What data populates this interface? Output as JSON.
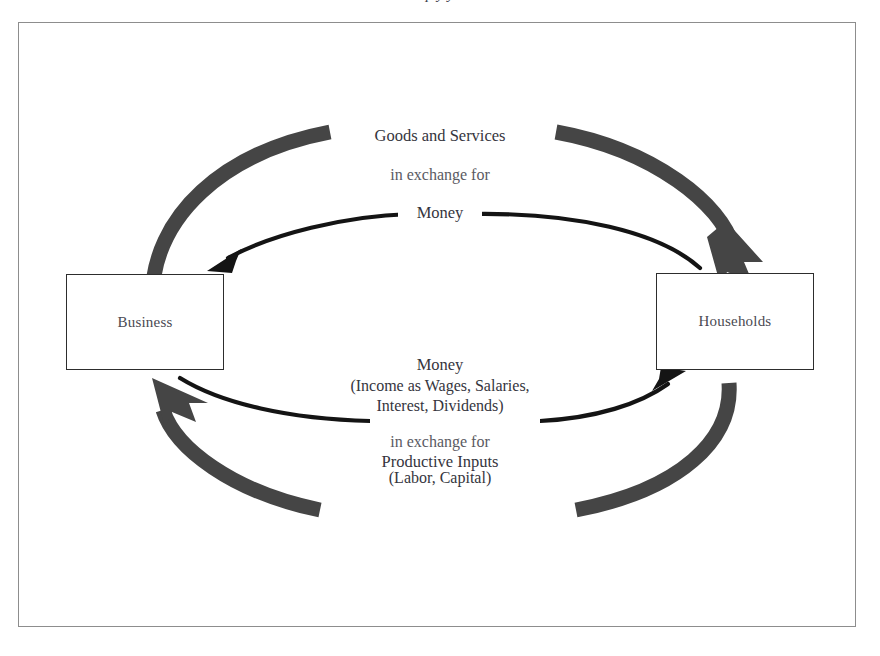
{
  "diagram": {
    "type": "circular-flow",
    "title_remnant": "p      y               y",
    "entities": [
      {
        "id": "business",
        "label": "Business"
      },
      {
        "id": "households",
        "label": "Households"
      }
    ],
    "labels": {
      "top": {
        "line1": "Goods and Services",
        "line2": "in exchange for",
        "line3": "Money"
      },
      "bottom": {
        "line1": "Money",
        "line2": "(Income as Wages, Salaries,",
        "line3": "Interest, Dividends)",
        "line4": "in exchange for",
        "line5": "Productive Inputs",
        "line6": "(Labor, Capital)"
      }
    },
    "flows": [
      {
        "id": "goods-and-services",
        "from": "business",
        "to": "households",
        "style": "thick-gray",
        "label": "Goods and Services"
      },
      {
        "id": "money-to-business",
        "from": "households",
        "to": "business",
        "style": "thin-black",
        "label": "Money"
      },
      {
        "id": "productive-inputs",
        "from": "households",
        "to": "business",
        "style": "thick-gray",
        "label": "Productive Inputs (Labor, Capital)"
      },
      {
        "id": "money-to-households",
        "from": "business",
        "to": "households",
        "style": "thin-black",
        "label": "Money (Income as Wages, Salaries, Interest, Dividends)"
      }
    ],
    "colors": {
      "thick_arrow": "#454545",
      "thin_arrow": "#111111",
      "box_border": "#2d2d2d",
      "frame_border": "#8d8d8d",
      "text_strong": "#35353d",
      "text_soft": "#5a5a62",
      "background": "#ffffff"
    }
  }
}
